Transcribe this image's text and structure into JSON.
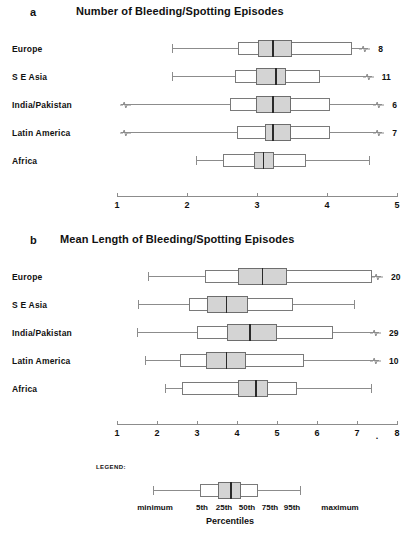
{
  "figure": {
    "panels": [
      {
        "letter": "a",
        "title": "Number of Bleeding/Spotting Episodes",
        "axis": {
          "min": 1,
          "max": 5,
          "ticks": [
            1,
            2,
            3,
            4,
            5
          ],
          "tick_labels": [
            "1",
            "2",
            "3",
            "4",
            "5"
          ],
          "break_marker": ""
        },
        "rows": [
          {
            "label": "Europe",
            "count": "8",
            "minimum": 1.79,
            "p5": 2.73,
            "p25": 3.02,
            "p50": 3.22,
            "p75": 3.5,
            "p95": 4.36,
            "maximum": 4.59,
            "left_break": false,
            "right_break": true
          },
          {
            "label": "S E Asia",
            "count": "11",
            "minimum": 1.79,
            "p5": 2.69,
            "p25": 2.98,
            "p50": 3.26,
            "p75": 3.41,
            "p95": 3.9,
            "maximum": 4.64,
            "left_break": false,
            "right_break": true
          },
          {
            "label": "India/Pakistan",
            "count": "6",
            "minimum": 1.05,
            "p5": 2.62,
            "p25": 2.98,
            "p50": 3.22,
            "p75": 3.48,
            "p95": 4.04,
            "maximum": 4.79,
            "left_break": true,
            "right_break": true
          },
          {
            "label": "Latin America",
            "count": "7",
            "minimum": 1.05,
            "p5": 2.72,
            "p25": 3.12,
            "p50": 3.22,
            "p75": 3.48,
            "p95": 4.04,
            "maximum": 4.79,
            "left_break": true,
            "right_break": true
          },
          {
            "label": "Africa",
            "count": "",
            "minimum": 2.13,
            "p5": 2.51,
            "p25": 2.95,
            "p50": 3.08,
            "p75": 3.24,
            "p95": 3.7,
            "maximum": 4.6,
            "left_break": false,
            "right_break": false
          }
        ]
      },
      {
        "letter": "b",
        "title": "Mean Length of Bleeding/Spotting Episodes",
        "axis": {
          "min": 1,
          "max": 8,
          "ticks": [
            1,
            2,
            3,
            4,
            5,
            6,
            7,
            8
          ],
          "tick_labels": [
            "1",
            "2",
            "3",
            "4",
            "5",
            "6",
            "7",
            "8"
          ],
          "break_marker": "."
        },
        "rows": [
          {
            "label": "Europe",
            "count": "20",
            "minimum": 1.78,
            "p5": 3.2,
            "p25": 4.02,
            "p50": 4.62,
            "p75": 5.25,
            "p95": 7.38,
            "maximum": 7.6,
            "left_break": false,
            "right_break": true
          },
          {
            "label": "S E Asia",
            "count": "",
            "minimum": 1.52,
            "p5": 2.8,
            "p25": 3.25,
            "p50": 3.72,
            "p75": 4.28,
            "p95": 5.4,
            "maximum": 6.92,
            "left_break": false,
            "right_break": false
          },
          {
            "label": "India/Pakistan",
            "count": "29",
            "minimum": 1.5,
            "p5": 3.0,
            "p25": 3.75,
            "p50": 4.3,
            "p75": 5.0,
            "p95": 6.4,
            "maximum": 7.55,
            "left_break": false,
            "right_break": true
          },
          {
            "label": "Latin America",
            "count": "10",
            "minimum": 1.7,
            "p5": 2.58,
            "p25": 3.22,
            "p50": 3.72,
            "p75": 4.22,
            "p95": 5.68,
            "maximum": 7.55,
            "left_break": false,
            "right_break": true
          },
          {
            "label": "Africa",
            "count": "",
            "minimum": 2.2,
            "p5": 2.62,
            "p25": 4.02,
            "p50": 4.45,
            "p75": 4.78,
            "p95": 5.5,
            "maximum": 7.35,
            "left_break": false,
            "right_break": false
          }
        ]
      }
    ],
    "legend": {
      "heading": "LEGEND:",
      "axis_title": "Percentiles",
      "minimum_label": "minimum",
      "maximum_label": "maximum",
      "percentile_labels": [
        "5th",
        "25th",
        "50th",
        "75th",
        "95th"
      ]
    },
    "colors": {
      "ink": "#111111",
      "line": "#8c8c8c",
      "box_fill": "#ffffff",
      "inner_box_fill": "#d4d4d4",
      "median": "#2a2a2a"
    }
  },
  "chart_data": {
    "type": "box",
    "panels": [
      {
        "id": "a",
        "title": "Number of Bleeding/Spotting Episodes",
        "xlabel": "",
        "ylabel": "",
        "xlim": [
          1,
          5
        ],
        "xticks": [
          1,
          2,
          3,
          4,
          5
        ],
        "grid": false,
        "categories": [
          "Europe",
          "S E Asia",
          "India/Pakistan",
          "Latin America",
          "Africa"
        ],
        "stats": [
          {
            "category": "Europe",
            "minimum": 1.79,
            "p5": 2.73,
            "p25": 3.02,
            "p50": 3.22,
            "p75": 3.5,
            "p95": 4.36,
            "maximum": 4.59,
            "n_label": 8
          },
          {
            "category": "S E Asia",
            "minimum": 1.79,
            "p5": 2.69,
            "p25": 2.98,
            "p50": 3.26,
            "p75": 3.41,
            "p95": 3.9,
            "maximum": 4.64,
            "n_label": 11
          },
          {
            "category": "India/Pakistan",
            "minimum": 1.05,
            "p5": 2.62,
            "p25": 2.98,
            "p50": 3.22,
            "p75": 3.48,
            "p95": 4.04,
            "maximum": 4.79,
            "n_label": 6
          },
          {
            "category": "Latin America",
            "minimum": 1.05,
            "p5": 2.72,
            "p25": 3.12,
            "p50": 3.22,
            "p75": 3.48,
            "p95": 4.04,
            "maximum": 4.79,
            "n_label": 7
          },
          {
            "category": "Africa",
            "minimum": 2.13,
            "p5": 2.51,
            "p25": 2.95,
            "p50": 3.08,
            "p75": 3.24,
            "p95": 3.7,
            "maximum": 4.6,
            "n_label": null
          }
        ]
      },
      {
        "id": "b",
        "title": "Mean Length of Bleeding/Spotting Episodes",
        "xlabel": "",
        "ylabel": "",
        "xlim": [
          1,
          8
        ],
        "xticks": [
          1,
          2,
          3,
          4,
          5,
          6,
          7,
          8
        ],
        "grid": false,
        "categories": [
          "Europe",
          "S E Asia",
          "India/Pakistan",
          "Latin America",
          "Africa"
        ],
        "stats": [
          {
            "category": "Europe",
            "minimum": 1.78,
            "p5": 3.2,
            "p25": 4.02,
            "p50": 4.62,
            "p75": 5.25,
            "p95": 7.38,
            "maximum": 7.6,
            "n_label": 20
          },
          {
            "category": "S E Asia",
            "minimum": 1.52,
            "p5": 2.8,
            "p25": 3.25,
            "p50": 3.72,
            "p75": 4.28,
            "p95": 5.4,
            "maximum": 6.92,
            "n_label": null
          },
          {
            "category": "India/Pakistan",
            "minimum": 1.5,
            "p5": 3.0,
            "p25": 3.75,
            "p50": 4.3,
            "p75": 5.0,
            "p95": 6.4,
            "maximum": 7.55,
            "n_label": 29
          },
          {
            "category": "Latin America",
            "minimum": 1.7,
            "p5": 2.58,
            "p25": 3.22,
            "p50": 3.72,
            "p75": 4.22,
            "p95": 5.68,
            "maximum": 7.55,
            "n_label": 10
          },
          {
            "category": "Africa",
            "minimum": 2.2,
            "p5": 2.62,
            "p25": 4.02,
            "p50": 4.45,
            "p75": 4.78,
            "p95": 5.5,
            "maximum": 7.35,
            "n_label": null
          }
        ]
      }
    ],
    "legend": {
      "position": "bottom",
      "entries": [
        "minimum",
        "5th",
        "25th",
        "50th",
        "75th",
        "95th",
        "maximum"
      ],
      "axis_title": "Percentiles"
    }
  }
}
